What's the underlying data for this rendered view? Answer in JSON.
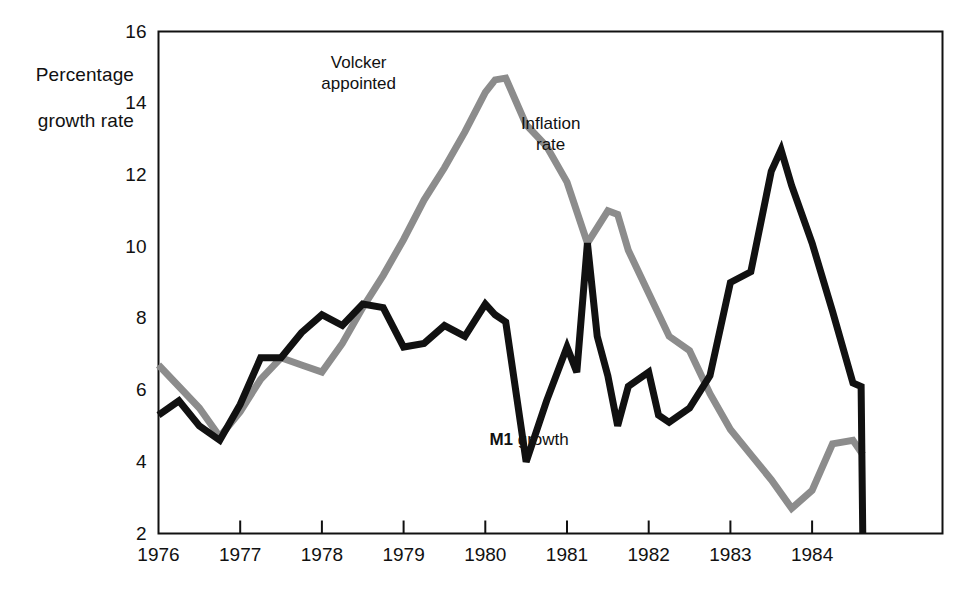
{
  "chart_data": {
    "type": "line",
    "title": "",
    "ylabel": "Percentage\ngrowth rate",
    "xlabel": "",
    "ylim": [
      2,
      16
    ],
    "xlim": [
      1976.0,
      1984.75
    ],
    "yticks": [
      2,
      4,
      6,
      8,
      10,
      12,
      14,
      16
    ],
    "ytick_labels": [
      "2",
      "4",
      "6",
      "8",
      "10",
      "12",
      "14",
      "16"
    ],
    "xticks": [
      1976,
      1977,
      1978,
      1979,
      1980,
      1981,
      1982,
      1983,
      1984
    ],
    "xtick_labels": [
      "1976",
      "1977",
      "1978",
      "1979",
      "1980",
      "1981",
      "1982",
      "1983",
      "1984"
    ],
    "grid": false,
    "legend_position": "inline-annotation",
    "annotations": [
      {
        "name": "volcker-appointed",
        "text": "Volcker\nappointed",
        "x": 1978.45,
        "y": 15.1
      },
      {
        "name": "inflation-rate-label",
        "text": "Inflation\nrate",
        "x": 1980.8,
        "y": 13.4
      },
      {
        "name": "m1-growth-label",
        "text_bold": "M1",
        "text_rest": " growth",
        "x": 1980.05,
        "y": 4.6
      }
    ],
    "series": [
      {
        "name": "Inflation rate",
        "color": "#8c8c8c",
        "stroke_width": 7,
        "x": [
          1976.0,
          1976.25,
          1976.5,
          1976.75,
          1977.0,
          1977.25,
          1977.5,
          1977.75,
          1978.0,
          1978.25,
          1978.5,
          1978.75,
          1979.0,
          1979.25,
          1979.5,
          1979.75,
          1980.0,
          1980.12,
          1980.25,
          1980.5,
          1980.75,
          1981.0,
          1981.25,
          1981.5,
          1981.62,
          1981.75,
          1982.0,
          1982.25,
          1982.5,
          1982.75,
          1983.0,
          1983.25,
          1983.5,
          1983.75,
          1984.0,
          1984.25,
          1984.5,
          1984.62
        ],
        "y": [
          6.7,
          6.1,
          5.5,
          4.7,
          5.4,
          6.3,
          6.9,
          6.7,
          6.5,
          7.3,
          8.3,
          9.2,
          10.2,
          11.3,
          12.2,
          13.2,
          14.3,
          14.65,
          14.7,
          13.4,
          12.8,
          11.8,
          10.1,
          11.0,
          10.9,
          9.9,
          8.7,
          7.5,
          7.1,
          5.9,
          4.9,
          4.2,
          3.5,
          2.7,
          3.2,
          4.5,
          4.6,
          4.2
        ]
      },
      {
        "name": "M1 growth",
        "color": "#111111",
        "stroke_width": 7,
        "x": [
          1976.0,
          1976.25,
          1976.5,
          1976.75,
          1977.0,
          1977.25,
          1977.5,
          1977.75,
          1978.0,
          1978.25,
          1978.5,
          1978.75,
          1979.0,
          1979.25,
          1979.5,
          1979.75,
          1980.0,
          1980.12,
          1980.25,
          1980.5,
          1980.75,
          1981.0,
          1981.12,
          1981.25,
          1981.37,
          1981.5,
          1981.62,
          1981.75,
          1982.0,
          1982.12,
          1982.25,
          1982.5,
          1982.75,
          1983.0,
          1983.25,
          1983.5,
          1983.62,
          1983.75,
          1984.0,
          1984.25,
          1984.5,
          1984.6,
          1984.62
        ],
        "y": [
          5.3,
          5.7,
          5.0,
          4.6,
          5.6,
          6.9,
          6.9,
          7.6,
          8.1,
          7.8,
          8.4,
          8.3,
          7.2,
          7.3,
          7.8,
          7.5,
          8.4,
          8.1,
          7.9,
          4.0,
          5.7,
          7.2,
          6.5,
          10.1,
          7.5,
          6.4,
          5.0,
          6.1,
          6.5,
          5.3,
          5.1,
          5.5,
          6.4,
          9.0,
          9.3,
          12.1,
          12.7,
          11.7,
          10.1,
          8.2,
          6.2,
          6.1,
          2.0
        ]
      }
    ]
  },
  "axis": {
    "ylabel_line1": "Percentage",
    "ylabel_line2": "growth rate"
  }
}
